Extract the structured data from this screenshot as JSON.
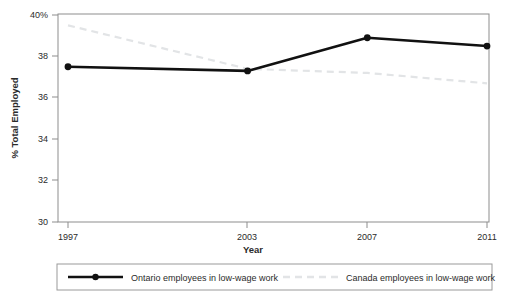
{
  "chart_data": {
    "type": "line",
    "title": "",
    "subtitle": "",
    "xlabel": "Year",
    "ylabel": "% Total Employed",
    "x": [
      1997,
      2003,
      2007,
      2011
    ],
    "xtick_labels": [
      "1997",
      "2003",
      "2007",
      "2011"
    ],
    "ytick_labels": [
      "30",
      "32",
      "34",
      "36",
      "38",
      "40%"
    ],
    "yticks": [
      30,
      32,
      34,
      36,
      38,
      40
    ],
    "xlim": [
      1997,
      2011
    ],
    "ylim": [
      30,
      40
    ],
    "grid": false,
    "legend_position": "bottom",
    "series": [
      {
        "name": "Ontario employees in low-wage work",
        "values": [
          37.5,
          37.3,
          38.9,
          38.5
        ],
        "color": "#111111",
        "style": "solid",
        "markers": true
      },
      {
        "name": "Canada employees in low-wage work",
        "values": [
          39.5,
          37.4,
          37.2,
          36.7
        ],
        "color": "#e2e4e6",
        "style": "dashed",
        "markers": false
      }
    ]
  },
  "axes": {
    "x_title": "Year",
    "y_title": "% Total Employed",
    "x_ticks": [
      {
        "label": "1997",
        "x": 68
      },
      {
        "label": "2003",
        "x": 247
      },
      {
        "label": "2007",
        "x": 367
      },
      {
        "label": "2011",
        "x": 487
      }
    ],
    "y_ticks": [
      {
        "label": "40%",
        "y": 15
      },
      {
        "label": "38",
        "y": 56
      },
      {
        "label": "36",
        "y": 97
      },
      {
        "label": "34",
        "y": 139
      },
      {
        "label": "32",
        "y": 180
      },
      {
        "label": "30",
        "y": 222
      }
    ]
  },
  "legend": {
    "entries": [
      {
        "label": "Ontario employees in low-wage work",
        "swatch": "solid-line-marker-swatch"
      },
      {
        "label": "Canada employees in low-wage work",
        "swatch": "dashed-line-swatch"
      }
    ]
  },
  "colors": {
    "series_ontario": "#111111",
    "series_canada": "#e2e4e6",
    "axis": "#7a7a7a",
    "text": "#2b2b2b",
    "background": "#ffffff",
    "legend_border": "#9a9a9a"
  }
}
